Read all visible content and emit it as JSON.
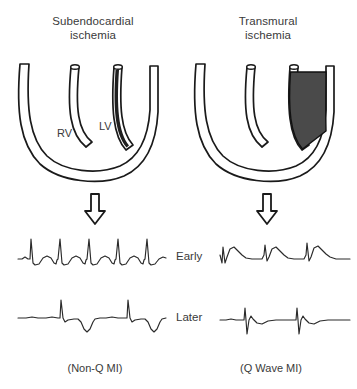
{
  "figure": {
    "columns": [
      {
        "id": "subendocardial",
        "title_line1": "Subendocardial",
        "title_line2": "ischemia",
        "caption": "(Non-Q MI)",
        "lesion": "thin dark subendocardial stripe on inner LV free wall",
        "chamber_labels": {
          "rv": "RV",
          "lv": "LV"
        }
      },
      {
        "id": "transmural",
        "title_line1": "Transmural",
        "title_line2": "ischemia",
        "caption": "(Q Wave MI)",
        "lesion": "thick dark full-thickness LV free wall region",
        "chamber_labels": {
          "rv": "",
          "lv": ""
        }
      }
    ],
    "row_labels": {
      "early": "Early",
      "later": "Later"
    },
    "arrow_icon": "down-block-arrow",
    "colors": {
      "ink": "#1a1a1a",
      "text": "#3a3a3a",
      "lesion_subendocardial": "#1f1f1f",
      "lesion_transmural": "#4a4a4a",
      "background": "#ffffff"
    },
    "ecg": {
      "early_left": {
        "name": "ST depression with tall R waves",
        "beats": 5,
        "feature": "ST segment depressed below baseline, upright T"
      },
      "early_right": {
        "name": "ST elevation",
        "beats": 3,
        "feature": "elevated convex ST segment (tombstone)"
      },
      "later_left": {
        "name": "Deep symmetric T wave inversion",
        "beats": 2,
        "feature": "tall R wave followed by deep inverted T, no Q wave"
      },
      "later_right": {
        "name": "Pathologic Q waves",
        "beats": 2,
        "feature": "deep wide Q wave deflection below baseline"
      }
    }
  }
}
